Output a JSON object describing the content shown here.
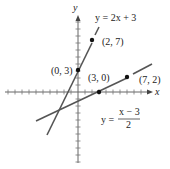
{
  "chart_data": {
    "type": "line",
    "title": "",
    "xlabel": "x",
    "ylabel": "y",
    "xlim": [
      -10,
      10
    ],
    "ylim": [
      -10,
      10
    ],
    "grid": false,
    "tick_spacing": 1,
    "series": [
      {
        "name": "y = 2x + 3",
        "equation": "y = 2x + 3",
        "x": [
          -4.5,
          3
        ],
        "y": [
          -6,
          9
        ]
      },
      {
        "name": "y = (x - 3)/2",
        "equation": "y = (x − 3)/2",
        "x": [
          -6,
          10.5
        ],
        "y": [
          -4.5,
          3.75
        ]
      }
    ],
    "points": [
      {
        "label": "(2, 7)",
        "x": 2,
        "y": 7
      },
      {
        "label": "(0, 3)",
        "x": 0,
        "y": 3
      },
      {
        "label": "(3, 0)",
        "x": 3,
        "y": 0
      },
      {
        "label": "(7, 2)",
        "x": 7,
        "y": 2
      }
    ],
    "annotations": [
      "y = 2x + 3",
      "y = (x − 3)/2"
    ]
  },
  "labels": {
    "x_axis": "x",
    "y_axis": "y",
    "eq1": "y = 2x + 3",
    "eq2_lhs": "y =",
    "eq2_num": "x − 3",
    "eq2_den": "2",
    "p1": "(2, 7)",
    "p2": "(0, 3)",
    "p3": "(3, 0)",
    "p4": "(7, 2)"
  },
  "colors": {
    "axis": "#555555",
    "line": "#555555",
    "point": "#111111"
  }
}
